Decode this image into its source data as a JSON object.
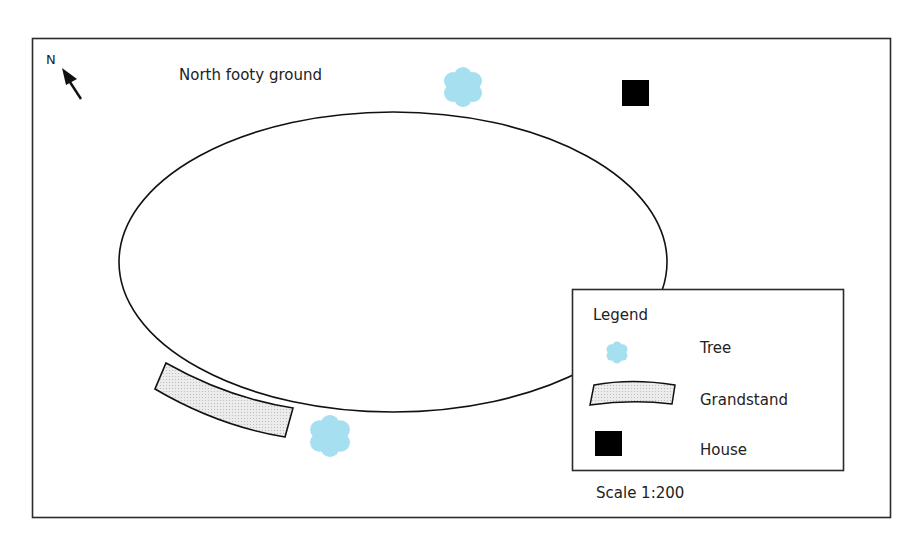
{
  "map": {
    "title": "North footy ground",
    "north_label": "N",
    "scale_text": "Scale 1:200",
    "colors": {
      "tree": "#a6dff0",
      "house": "#000000",
      "grandstand_fill": "#e6e6e6",
      "outline": "#1a1a1a"
    },
    "features": [
      {
        "type": "oval",
        "name": "playing-field"
      },
      {
        "type": "tree",
        "position": "north, top of oval"
      },
      {
        "type": "tree",
        "position": "south, beside grandstand"
      },
      {
        "type": "house",
        "position": "north-east"
      },
      {
        "type": "grandstand",
        "position": "south-west, along oval edge"
      }
    ]
  },
  "legend": {
    "title": "Legend",
    "items": [
      {
        "symbol": "tree",
        "label": "Tree"
      },
      {
        "symbol": "grandstand",
        "label": "Grandstand"
      },
      {
        "symbol": "house",
        "label": "House"
      }
    ]
  }
}
